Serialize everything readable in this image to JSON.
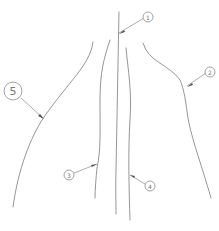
{
  "figure": {
    "type": "patent-line-drawing",
    "line_color": "#8a8a8a",
    "background": "#ffffff"
  },
  "callouts": [
    {
      "id": "1",
      "label": "1"
    },
    {
      "id": "2",
      "label": "2"
    },
    {
      "id": "3",
      "label": "3"
    },
    {
      "id": "4",
      "label": "4"
    },
    {
      "id": "5",
      "label": "5"
    }
  ]
}
